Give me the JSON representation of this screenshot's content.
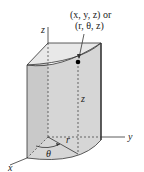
{
  "diagram": {
    "type": "cylindrical-coordinates",
    "point_label_line1": "(x, y, z) or",
    "point_label_line2": "(r, θ, z)",
    "axes": {
      "x_label": "x",
      "y_label": "y",
      "z_label": "z"
    },
    "height_label": "z",
    "radius_label": "r",
    "angle_label": "θ",
    "colors": {
      "solid_fill": "#d9d9d9",
      "top_fill": "#e6e6e6",
      "front_fill": "#cfcfcf",
      "stroke": "#333333",
      "point": "#000000"
    }
  }
}
